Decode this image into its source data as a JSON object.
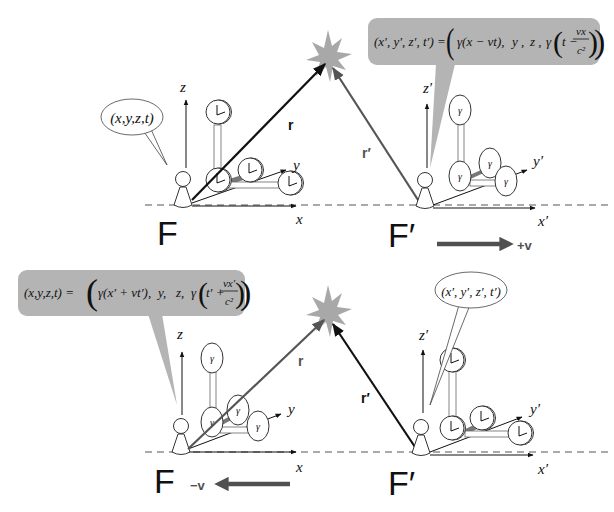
{
  "colors": {
    "background": "#ffffff",
    "ink": "#111111",
    "gray_vector": "#555555",
    "formula_box": "#b4b4b4",
    "explosion": "#a8a8a8",
    "velocity_arrow": "#505050"
  },
  "top_panel": {
    "frame_label": "F",
    "frame_prime_label": "F′",
    "axes": {
      "x": "x",
      "y": "y",
      "z": "z",
      "x_prime": "x′",
      "y_prime": "y′",
      "z_prime": "z′"
    },
    "vector_r": "r",
    "vector_r_prime": "r′",
    "speech_bubble": "(x,y,z,t)",
    "formula": {
      "lhs": "(x′, y′, z′, t′) =",
      "gamma_term": "γ(x − vt),",
      "y_term": "y ,",
      "z_term": "z ,",
      "time_term_prefix": "γ",
      "time_t": "t −",
      "frac_num": "vx",
      "frac_den": "c²"
    },
    "velocity_label": "+v"
  },
  "bottom_panel": {
    "frame_label": "F",
    "frame_prime_label": "F′",
    "axes": {
      "x": "x",
      "y": "y",
      "z": "z",
      "x_prime": "x′",
      "y_prime": "y′",
      "z_prime": "z′"
    },
    "vector_r": "r",
    "vector_r_prime": "r′",
    "speech_bubble": "(x′, y′, z′, t′)",
    "formula": {
      "lhs": "(x,y,z,t) =",
      "gamma_term": "γ(x′ + vt′),",
      "y_term": "y,",
      "z_term": "z,",
      "time_term_prefix": "γ",
      "time_t": "t′ +",
      "frac_num": "vx′",
      "frac_den": "c²"
    },
    "velocity_label": "−v"
  }
}
